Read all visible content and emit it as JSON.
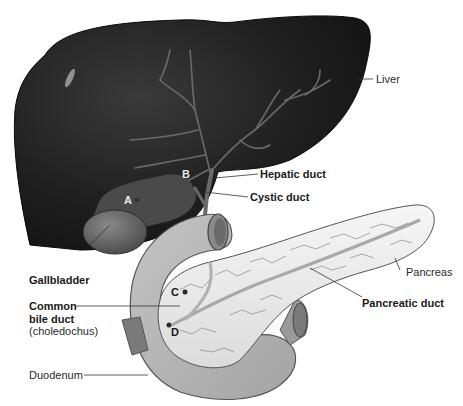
{
  "diagram": {
    "labels": {
      "liver": "Liver",
      "hepatic_duct": "Hepatic duct",
      "cystic_duct": "Cystic duct",
      "gallbladder": "Gallbladder",
      "pancreas": "Pancreas",
      "common_bile_duct_line1": "Common",
      "common_bile_duct_line2": "bile duct",
      "common_bile_duct_line3": "(choledochus)",
      "pancreatic_duct": "Pancreatic duct",
      "duodenum": "Duodenum"
    },
    "markers": {
      "a": "A",
      "b": "B",
      "c": "C",
      "d": "D"
    },
    "colors": {
      "liver": "#1c1c1c",
      "ducts": "#7a7a7a",
      "gallbladder": "#5a5a5a",
      "duodenum": "#b8b8b8",
      "pancreas": "#efefef",
      "leader_line": "#333333"
    }
  }
}
